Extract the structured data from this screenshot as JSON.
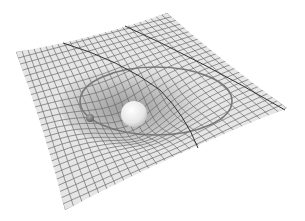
{
  "scene": {
    "title": "Spacetime curvature illustration",
    "background": "#ffffff",
    "grid_color": "#6a6a6a",
    "sheet_fill": "#e4e4e4",
    "well_shade": "#b8b8b8",
    "orbit_color": "#777777",
    "geodesic_color": "#333333",
    "large_mass": {
      "cx": 134,
      "cy": 114,
      "r": 13,
      "color": "#eeeeee"
    },
    "small_mass": {
      "cx": 90,
      "cy": 118,
      "r": 4,
      "color": "#8a8a8a"
    },
    "sheet_corners": {
      "top_left": [
        16,
        52
      ],
      "top_right": [
        167,
        13
      ],
      "right": [
        287,
        108
      ],
      "bottom": [
        65,
        210
      ]
    },
    "grid_divisions": 26
  }
}
